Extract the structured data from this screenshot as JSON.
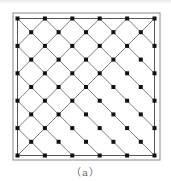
{
  "figure": {
    "caption": "（a）",
    "lattice": {
      "corner_rows": 6,
      "corner_cols": 6,
      "center_rows": 5,
      "center_cols": 5,
      "origin": [
        17.5,
        18.5
      ],
      "spacing": 27.4,
      "line_style": "diagonal",
      "line_color": "#6e6e6e",
      "node_color": "#111111",
      "node_radius": 2
    },
    "frame": {
      "outer": {
        "x": 13,
        "y": 13,
        "w": 147,
        "h": 147,
        "color": "#8a8a8a"
      },
      "inner": {
        "x": 17.5,
        "y": 18.5,
        "w": 137,
        "h": 137,
        "color": "#555555"
      }
    }
  }
}
